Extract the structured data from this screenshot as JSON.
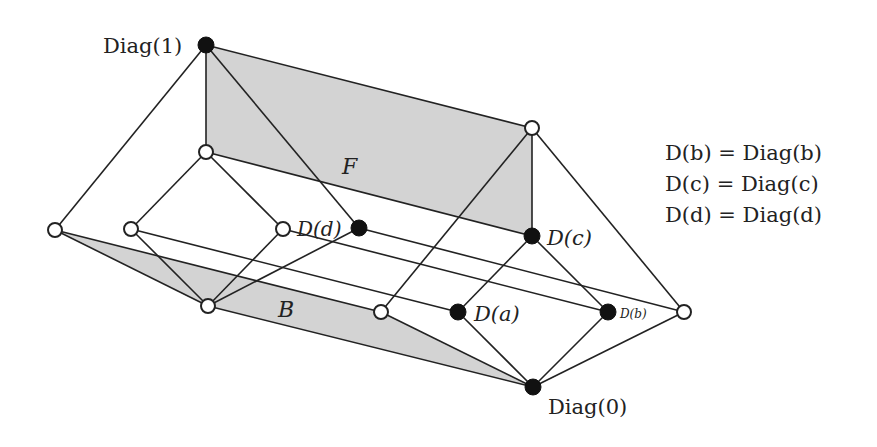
{
  "diagram": {
    "colors": {
      "region_fill": "#d3d3d3",
      "stroke": "#222222",
      "filled_node": "#111111",
      "open_node": "#ffffff"
    },
    "regions": [
      {
        "id": "F",
        "label": "F",
        "points": [
          [
            206,
            45
          ],
          [
            532,
            128
          ],
          [
            532,
            236
          ],
          [
            206,
            152
          ]
        ],
        "label_pos": [
          352,
          172
        ]
      },
      {
        "id": "B",
        "label": "B",
        "points": [
          [
            55,
            230
          ],
          [
            381,
            312
          ],
          [
            533,
            387
          ],
          [
            208,
            306
          ]
        ],
        "label_pos": [
          288,
          315
        ]
      }
    ],
    "nodes": [
      {
        "id": "diag1",
        "x": 206,
        "y": 45,
        "filled": true,
        "label": "Diag(1)"
      },
      {
        "id": "top_right",
        "x": 532,
        "y": 128,
        "filled": false
      },
      {
        "id": "upper_left",
        "x": 206,
        "y": 152,
        "filled": false
      },
      {
        "id": "far_left",
        "x": 55,
        "y": 230,
        "filled": false
      },
      {
        "id": "left_inner",
        "x": 131,
        "y": 229,
        "filled": false
      },
      {
        "id": "mid",
        "x": 283,
        "y": 229,
        "filled": false
      },
      {
        "id": "Dd",
        "x": 359,
        "y": 228,
        "filled": true,
        "label": "D(d)"
      },
      {
        "id": "Dc",
        "x": 532,
        "y": 236,
        "filled": true,
        "label": "D(c)"
      },
      {
        "id": "b_node",
        "x": 208,
        "y": 306,
        "filled": false
      },
      {
        "id": "low_mid",
        "x": 381,
        "y": 312,
        "filled": false
      },
      {
        "id": "Da",
        "x": 458,
        "y": 312,
        "filled": true,
        "label": "D(a)"
      },
      {
        "id": "Db",
        "x": 608,
        "y": 312,
        "filled": true,
        "label": "D(b)"
      },
      {
        "id": "far_right",
        "x": 684,
        "y": 312,
        "filled": false
      },
      {
        "id": "diag0",
        "x": 533,
        "y": 387,
        "filled": true,
        "label": "Diag(0)"
      }
    ],
    "edges": [
      [
        "diag1",
        "top_right"
      ],
      [
        "diag1",
        "upper_left"
      ],
      [
        "diag1",
        "far_left"
      ],
      [
        "diag1",
        "Dd"
      ],
      [
        "top_right",
        "Dc"
      ],
      [
        "top_right",
        "low_mid"
      ],
      [
        "top_right",
        "far_right"
      ],
      [
        "upper_left",
        "left_inner"
      ],
      [
        "upper_left",
        "mid"
      ],
      [
        "upper_left",
        "Dc"
      ],
      [
        "far_left",
        "b_node"
      ],
      [
        "far_left",
        "low_mid"
      ],
      [
        "left_inner",
        "b_node"
      ],
      [
        "left_inner",
        "Da"
      ],
      [
        "mid",
        "b_node"
      ],
      [
        "mid",
        "Db"
      ],
      [
        "Dd",
        "b_node"
      ],
      [
        "Dd",
        "far_right"
      ],
      [
        "Dc",
        "Da"
      ],
      [
        "Dc",
        "Db"
      ],
      [
        "b_node",
        "diag0"
      ],
      [
        "low_mid",
        "diag0"
      ],
      [
        "Da",
        "diag0"
      ],
      [
        "Db",
        "diag0"
      ],
      [
        "far_right",
        "diag0"
      ]
    ],
    "labels": {
      "diag1": "Diag(1)",
      "diag0": "Diag(0)",
      "Da": "D(a)",
      "Db": "D(b)",
      "Dc": "D(c)",
      "Dd": "D(d)",
      "F": "F",
      "B": "B"
    },
    "legend": [
      "D(b) = Diag(b)",
      "D(c) = Diag(c)",
      "D(d) = Diag(d)"
    ]
  }
}
